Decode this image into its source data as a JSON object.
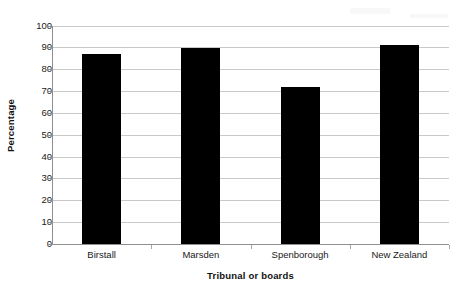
{
  "chart_data": {
    "type": "bar",
    "title": "",
    "categories": [
      "Birstall",
      "Marsden",
      "Spenborough",
      "New Zealand"
    ],
    "values": [
      87,
      89.5,
      72,
      91
    ],
    "xlabel": "Tribunal or boards",
    "ylabel": "Percentage",
    "ylim": [
      0,
      100
    ],
    "ytick_step": 10,
    "yticks": [
      100,
      90,
      80,
      70,
      60,
      50,
      40,
      30,
      20,
      10,
      0
    ],
    "ytick_labels": [
      "100",
      "90",
      "80",
      "70",
      "60",
      "50",
      "40",
      "30",
      "20",
      "10",
      "0"
    ],
    "grid": true,
    "grid_axis": "y",
    "legend": false,
    "bar_color": "#000000",
    "grid_color": "#c9c9c9",
    "axis_color": "#8f8f8f",
    "background": "#ffffff"
  },
  "axes": {
    "x_title": "Tribunal or boards",
    "y_title": "Percentage"
  }
}
